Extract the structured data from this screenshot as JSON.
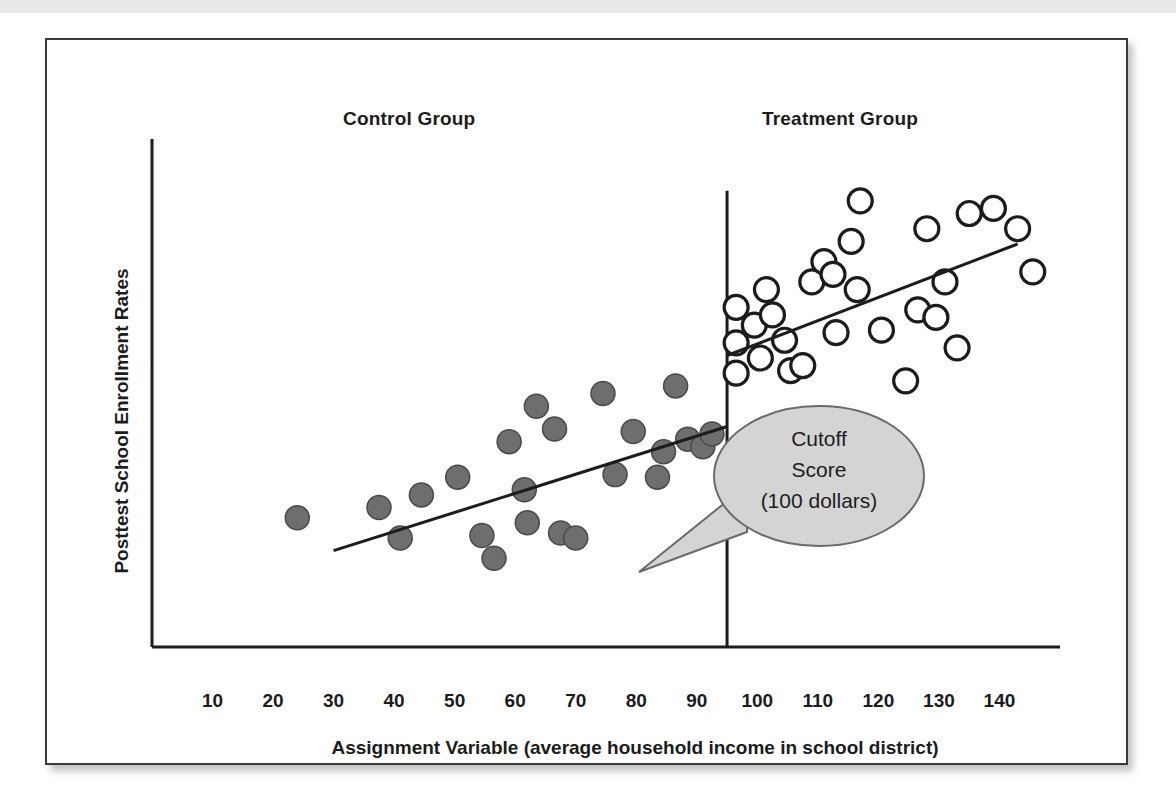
{
  "figure": {
    "y_axis_title": "Posttest  School Enrollment Rates",
    "x_axis_title": "Assignment Variable (average household income in school district)",
    "headings": {
      "control": "Control Group",
      "treatment": "Treatment Group"
    },
    "callout": {
      "line1": "Cutoff",
      "line2": "Score",
      "line3": "(100 dollars)"
    },
    "colors": {
      "control_point_fill": "#6e6e6e",
      "control_point_stroke": "#4a4a4a",
      "treatment_point_fill": "#ffffff",
      "treatment_point_stroke": "#1c1c1c",
      "axis": "#1c1c1c",
      "callout_fill": "#d4d4d4",
      "frame": "#3a3a3a"
    }
  },
  "chart_data": {
    "type": "scatter",
    "title": "",
    "xlabel": "Assignment Variable (average household income in school district)",
    "ylabel": "Posttest  School Enrollment Rates",
    "xlim": [
      0,
      150
    ],
    "ylim": [
      0,
      100
    ],
    "grid": false,
    "legend": "none",
    "annotations": [
      {
        "name": "control-group-heading",
        "text": "Control Group",
        "x": 50,
        "y": 97
      },
      {
        "name": "treatment-group-heading",
        "text": "Treatment Group",
        "x": 120,
        "y": 97
      },
      {
        "name": "cutoff-callout",
        "text": "Cutoff Score (100 dollars)",
        "x": 118,
        "y": 42
      }
    ],
    "cutoff": {
      "label": "Cutoff Score (100 dollars)",
      "x_value": 95,
      "y_top": 90,
      "y_bottom": 0
    },
    "x_ticks": [
      10,
      20,
      30,
      40,
      50,
      60,
      70,
      80,
      90,
      100,
      110,
      120,
      130,
      140
    ],
    "x_tick_labels": [
      "10",
      "20",
      "30",
      "40",
      "50",
      "60",
      "70",
      "80",
      "90",
      "100",
      "110",
      "120",
      "130",
      "140"
    ],
    "y_ticks": [],
    "series": [
      {
        "name": "Control Group",
        "marker": "filled-circle",
        "color": "#6e6e6e",
        "points": [
          [
            24.0,
            25.5
          ],
          [
            37.5,
            27.5
          ],
          [
            41.0,
            21.5
          ],
          [
            44.5,
            30.0
          ],
          [
            50.5,
            33.5
          ],
          [
            54.5,
            22.0
          ],
          [
            56.5,
            17.5
          ],
          [
            59.0,
            40.5
          ],
          [
            61.5,
            31.0
          ],
          [
            62.0,
            24.5
          ],
          [
            63.5,
            47.5
          ],
          [
            66.5,
            43.0
          ],
          [
            67.5,
            22.5
          ],
          [
            70.0,
            21.5
          ],
          [
            74.5,
            50.0
          ],
          [
            76.5,
            34.0
          ],
          [
            79.5,
            42.5
          ],
          [
            83.5,
            33.5
          ],
          [
            84.5,
            38.5
          ],
          [
            86.5,
            51.5
          ],
          [
            88.5,
            41.0
          ],
          [
            91.0,
            39.5
          ],
          [
            92.5,
            42.0
          ]
        ]
      },
      {
        "name": "Treatment Group",
        "marker": "open-circle",
        "color": "#ffffff",
        "points": [
          [
            96.5,
            67.0
          ],
          [
            96.5,
            60.0
          ],
          [
            96.5,
            54.0
          ],
          [
            99.5,
            63.5
          ],
          [
            100.5,
            57.0
          ],
          [
            101.5,
            70.5
          ],
          [
            102.5,
            65.5
          ],
          [
            104.5,
            60.5
          ],
          [
            105.5,
            54.5
          ],
          [
            107.5,
            55.5
          ],
          [
            109.0,
            72.0
          ],
          [
            111.0,
            76.0
          ],
          [
            112.5,
            73.5
          ],
          [
            113.0,
            62.0
          ],
          [
            115.5,
            80.0
          ],
          [
            116.5,
            70.5
          ],
          [
            117.0,
            88.0
          ],
          [
            120.5,
            62.5
          ],
          [
            124.5,
            52.5
          ],
          [
            126.5,
            66.5
          ],
          [
            128.0,
            82.5
          ],
          [
            129.5,
            65.0
          ],
          [
            131.0,
            72.0
          ],
          [
            133.0,
            59.0
          ],
          [
            135.0,
            85.5
          ],
          [
            139.0,
            86.5
          ],
          [
            143.0,
            82.5
          ],
          [
            145.5,
            74.0
          ]
        ]
      }
    ],
    "fit_lines": [
      {
        "name": "control-regression-line",
        "x0": 30.0,
        "y0": 19.0,
        "x1": 95.0,
        "y1": 43.5
      },
      {
        "name": "treatment-regression-line",
        "x0": 95.0,
        "y0": 57.5,
        "x1": 143.0,
        "y1": 79.5
      }
    ]
  }
}
